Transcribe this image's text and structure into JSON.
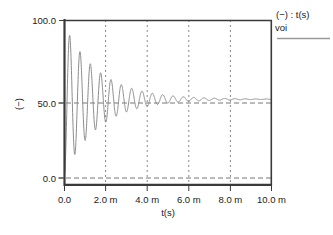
{
  "plot": {
    "title": "",
    "legend": {
      "header": "(−) : t(s)",
      "series_label": "voi",
      "line_color": "#808080"
    },
    "yaxis": {
      "label": "(−)",
      "ticks": [
        "100.0",
        "50.0",
        "0.0"
      ],
      "tick_values": [
        100.0,
        50.0,
        0.0
      ],
      "min": 0.0,
      "max": 100.0
    },
    "xaxis": {
      "label": "t(s)",
      "ticks": [
        "0.0",
        "2.0 m",
        "4.0 m",
        "6.0 m",
        "8.0 m",
        "10.0 m"
      ],
      "tick_values": [
        0.0,
        0.002,
        0.004,
        0.006,
        0.008,
        0.01
      ],
      "min": 0.0,
      "max": 0.01
    },
    "colors": {
      "frame": "#3a3a3a",
      "grid": "#999999",
      "trace": "#8c8c8c",
      "background": "#ffffff",
      "text": "#1a1a1a"
    }
  },
  "chart_data": {
    "type": "line",
    "title": "",
    "xlabel": "t(s)",
    "ylabel": "(−)",
    "xlim": [
      0.0,
      0.01
    ],
    "ylim": [
      0.0,
      100.0
    ],
    "grid": true,
    "grid_style": "dashed vertical at x ticks, dashed horizontal at y=50 and y=0",
    "legend": [
      "voi"
    ],
    "legend_position": "outside-top-right",
    "xtick_labels": [
      "0.0",
      "2.0 m",
      "4.0 m",
      "6.0 m",
      "8.0 m",
      "10.0 m"
    ],
    "xtick_values": [
      0.0,
      0.002,
      0.004,
      0.006,
      0.008,
      0.01
    ],
    "ytick_labels": [
      "100.0",
      "50.0",
      "0.0"
    ],
    "ytick_values": [
      100.0,
      50.0,
      0.0
    ],
    "series": [
      {
        "name": "voi",
        "color": "#8c8c8c",
        "model": {
          "form": "50 + A*exp(-t/tau)*cos(2*pi*f*t + phase)",
          "steady_state": 50.0,
          "amplitude": 47.0,
          "tau_s": 0.0017,
          "frequency_hz": 2000.0,
          "phase_rad": 3.14159,
          "start_value": 50.0
        },
        "points": [
          [
            0.0,
            50.0
          ],
          [
            0.0001,
            68.9
          ],
          [
            0.0002,
            88.1
          ],
          [
            0.00025,
            94.6
          ],
          [
            0.0003,
            95.0
          ],
          [
            0.0004,
            79.8
          ],
          [
            0.0005,
            56.4
          ],
          [
            0.0006,
            30.1
          ],
          [
            0.00072,
            12.8
          ],
          [
            0.0008,
            14.9
          ],
          [
            0.0009,
            28.3
          ],
          [
            0.001,
            48.4
          ],
          [
            0.0011,
            68.3
          ],
          [
            0.00125,
            85.2
          ],
          [
            0.0013,
            85.6
          ],
          [
            0.0014,
            76.1
          ],
          [
            0.0015,
            58.7
          ],
          [
            0.0016,
            38.1
          ],
          [
            0.00172,
            22.4
          ],
          [
            0.0018,
            21.0
          ],
          [
            0.0019,
            30.5
          ],
          [
            0.002,
            45.7
          ],
          [
            0.0021,
            62.0
          ],
          [
            0.00225,
            76.2
          ],
          [
            0.0023,
            77.2
          ],
          [
            0.0024,
            70.5
          ],
          [
            0.0025,
            57.7
          ],
          [
            0.0026,
            42.7
          ],
          [
            0.00272,
            30.3
          ],
          [
            0.0028,
            28.7
          ],
          [
            0.0029,
            34.8
          ],
          [
            0.003,
            46.0
          ],
          [
            0.0031,
            58.3
          ],
          [
            0.00325,
            69.5
          ],
          [
            0.0033,
            70.3
          ],
          [
            0.0034,
            65.8
          ],
          [
            0.0035,
            56.5
          ],
          [
            0.0036,
            45.6
          ],
          [
            0.00372,
            36.0
          ],
          [
            0.0038,
            34.5
          ],
          [
            0.0039,
            38.3
          ],
          [
            0.004,
            46.4
          ],
          [
            0.0041,
            55.6
          ],
          [
            0.00425,
            64.0
          ],
          [
            0.0043,
            64.6
          ],
          [
            0.0044,
            61.5
          ],
          [
            0.0045,
            54.8
          ],
          [
            0.0046,
            46.9
          ],
          [
            0.00472,
            39.7
          ],
          [
            0.0048,
            38.4
          ],
          [
            0.0049,
            40.9
          ],
          [
            0.005,
            46.8
          ],
          [
            0.0051,
            53.6
          ],
          [
            0.00525,
            59.8
          ],
          [
            0.0053,
            60.2
          ],
          [
            0.0054,
            58.0
          ],
          [
            0.0055,
            53.2
          ],
          [
            0.0056,
            47.5
          ],
          [
            0.00572,
            42.2
          ],
          [
            0.0058,
            41.1
          ],
          [
            0.0059,
            42.7
          ],
          [
            0.006,
            47.0
          ],
          [
            0.0061,
            51.9
          ],
          [
            0.00625,
            56.4
          ],
          [
            0.0063,
            56.7
          ],
          [
            0.0064,
            55.2
          ],
          [
            0.0065,
            51.7
          ],
          [
            0.0066,
            47.5
          ],
          [
            0.00672,
            43.7
          ],
          [
            0.0068,
            42.9
          ],
          [
            0.0069,
            43.9
          ],
          [
            0.007,
            47.1
          ],
          [
            0.0071,
            50.7
          ],
          [
            0.00725,
            54.0
          ],
          [
            0.0073,
            54.2
          ],
          [
            0.0074,
            53.1
          ],
          [
            0.0075,
            50.5
          ],
          [
            0.0076,
            47.5
          ],
          [
            0.0077,
            45.3
          ],
          [
            0.0078,
            45.1
          ],
          [
            0.0079,
            46.1
          ],
          [
            0.008,
            48.5
          ],
          [
            0.0081,
            50.7
          ],
          [
            0.0082,
            51.8
          ],
          [
            0.0083,
            51.4
          ],
          [
            0.0084,
            49.9
          ],
          [
            0.0085,
            48.3
          ],
          [
            0.0086,
            47.7
          ],
          [
            0.0087,
            48.4
          ],
          [
            0.0088,
            49.7
          ],
          [
            0.0089,
            50.7
          ],
          [
            0.009,
            50.8
          ],
          [
            0.0091,
            50.1
          ],
          [
            0.0092,
            49.4
          ],
          [
            0.0093,
            49.3
          ],
          [
            0.0094,
            49.8
          ],
          [
            0.0095,
            50.3
          ],
          [
            0.0096,
            50.4
          ],
          [
            0.0097,
            50.1
          ],
          [
            0.0098,
            49.9
          ],
          [
            0.0099,
            49.9
          ],
          [
            0.01,
            50.0
          ]
        ]
      }
    ]
  }
}
